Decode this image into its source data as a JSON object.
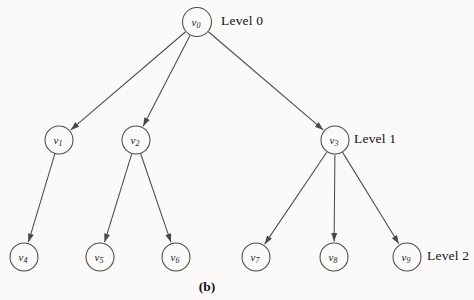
{
  "figure": {
    "caption": "(b)",
    "background_color": "#fbfaf8",
    "stroke_color": "#4a4a4a",
    "text_color": "#141414"
  },
  "nodes": [
    {
      "id": "v0",
      "letter": "v",
      "subscript": "0",
      "cx": 197,
      "cy": 22,
      "r": 14.5,
      "level": 0
    },
    {
      "id": "v1",
      "letter": "v",
      "subscript": "1",
      "cx": 59,
      "cy": 140,
      "r": 14.0,
      "level": 1
    },
    {
      "id": "v2",
      "letter": "v",
      "subscript": "2",
      "cx": 136,
      "cy": 140,
      "r": 14.0,
      "level": 1
    },
    {
      "id": "v3",
      "letter": "v",
      "subscript": "3",
      "cx": 335,
      "cy": 140,
      "r": 14.0,
      "level": 1
    },
    {
      "id": "v4",
      "letter": "v",
      "subscript": "4",
      "cx": 24,
      "cy": 257,
      "r": 14.0,
      "level": 2
    },
    {
      "id": "v5",
      "letter": "v",
      "subscript": "5",
      "cx": 100,
      "cy": 257,
      "r": 14.0,
      "level": 2
    },
    {
      "id": "v6",
      "letter": "v",
      "subscript": "6",
      "cx": 176,
      "cy": 257,
      "r": 14.0,
      "level": 2
    },
    {
      "id": "v7",
      "letter": "v",
      "subscript": "7",
      "cx": 256,
      "cy": 257,
      "r": 14.0,
      "level": 2
    },
    {
      "id": "v8",
      "letter": "v",
      "subscript": "8",
      "cx": 334,
      "cy": 257,
      "r": 14.0,
      "level": 2
    },
    {
      "id": "v9",
      "letter": "v",
      "subscript": "9",
      "cx": 407,
      "cy": 257,
      "r": 14.0,
      "level": 2
    }
  ],
  "edges": [
    {
      "from": "v0",
      "to": "v1",
      "directed": true
    },
    {
      "from": "v0",
      "to": "v2",
      "directed": true
    },
    {
      "from": "v0",
      "to": "v3",
      "directed": true
    },
    {
      "from": "v1",
      "to": "v4",
      "directed": true
    },
    {
      "from": "v2",
      "to": "v5",
      "directed": true
    },
    {
      "from": "v2",
      "to": "v6",
      "directed": true
    },
    {
      "from": "v3",
      "to": "v7",
      "directed": true
    },
    {
      "from": "v3",
      "to": "v8",
      "directed": true
    },
    {
      "from": "v3",
      "to": "v9",
      "directed": true
    }
  ],
  "level_labels": [
    {
      "id": "level-0",
      "text": "Level 0"
    },
    {
      "id": "level-1",
      "text": "Level 1"
    },
    {
      "id": "level-2",
      "text": "Level 2"
    }
  ]
}
